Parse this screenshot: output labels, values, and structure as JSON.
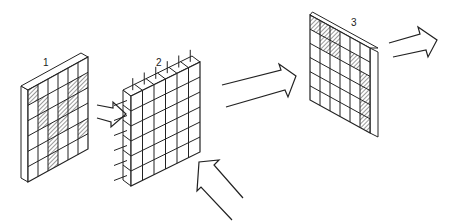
{
  "diagram": {
    "background": "#ffffff",
    "stroke_color": "#222222",
    "hatch_color": "#333333",
    "panels": [
      {
        "id": "panel-1",
        "label": "1",
        "label_pos": [
          43,
          58
        ],
        "front": {
          "tl": [
            28,
            90
          ],
          "tr": [
            88,
            57
          ],
          "bl": [
            28,
            182
          ]
        },
        "depth": [
          -7,
          -4
        ],
        "depth_side": "left",
        "rows": 6,
        "cols": 6,
        "hatched": [
          [
            0,
            0
          ],
          [
            1,
            1
          ],
          [
            1,
            4
          ],
          [
            1,
            5
          ],
          [
            2,
            1
          ],
          [
            2,
            3
          ],
          [
            2,
            4
          ],
          [
            3,
            2
          ],
          [
            3,
            3
          ],
          [
            4,
            2
          ],
          [
            4,
            5
          ],
          [
            5,
            2
          ]
        ],
        "pins": false
      },
      {
        "id": "panel-2",
        "label": "2",
        "label_pos": [
          156,
          58
        ],
        "front": {
          "tl": [
            131,
            96
          ],
          "tr": [
            200,
            62
          ],
          "bl": [
            131,
            186
          ]
        },
        "depth": [
          -8,
          -6
        ],
        "depth_side": "top-left",
        "rows": 6,
        "cols": 6,
        "hatched": [],
        "pins": true
      },
      {
        "id": "panel-3",
        "label": "3",
        "label_pos": [
          351,
          18
        ],
        "front": {
          "tl": [
            310,
            15
          ],
          "tr": [
            370,
            48
          ],
          "bl": [
            310,
            100
          ]
        },
        "depth": [
          8,
          4
        ],
        "depth_side": "right",
        "rows": 6,
        "cols": 6,
        "hatched": [
          [
            0,
            0
          ],
          [
            0,
            1
          ],
          [
            0,
            2
          ],
          [
            1,
            1
          ],
          [
            1,
            2
          ],
          [
            1,
            4
          ],
          [
            2,
            5
          ],
          [
            3,
            5
          ],
          [
            4,
            5
          ],
          [
            5,
            5
          ]
        ],
        "pins": false
      }
    ],
    "arrows": [
      {
        "id": "arrow-1-to-2",
        "points": [
          [
            97,
            105
          ],
          [
            113,
            108
          ],
          [
            113,
            102
          ],
          [
            126,
            114
          ],
          [
            111,
            127
          ],
          [
            111,
            122
          ],
          [
            97,
            118
          ]
        ]
      },
      {
        "id": "arrow-2-to-3",
        "points": [
          [
            222,
            85
          ],
          [
            281,
            70
          ],
          [
            279,
            64
          ],
          [
            296,
            76
          ],
          [
            288,
            97
          ],
          [
            285,
            90
          ],
          [
            226,
            107
          ]
        ]
      },
      {
        "id": "arrow-input-below",
        "points": [
          [
            232,
            220
          ],
          [
            201,
            187
          ],
          [
            197,
            191
          ],
          [
            199,
            162
          ],
          [
            219,
            160
          ],
          [
            214,
            165
          ],
          [
            243,
            198
          ]
        ]
      },
      {
        "id": "arrow-output",
        "points": [
          [
            389,
            43
          ],
          [
            420,
            34
          ],
          [
            418,
            27
          ],
          [
            437,
            40
          ],
          [
            428,
            57
          ],
          [
            426,
            50
          ],
          [
            393,
            57
          ]
        ]
      }
    ]
  }
}
